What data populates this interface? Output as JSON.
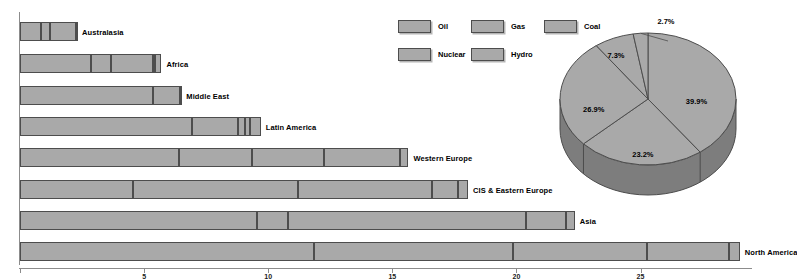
{
  "chart_data": [
    {
      "type": "bar",
      "orientation": "horizontal",
      "stacked": true,
      "title": "",
      "xlabel": "",
      "ylabel": "",
      "xlim": [
        0,
        29.5
      ],
      "grid": false,
      "axis_ticks": [
        {
          "value": 0,
          "label": ""
        },
        {
          "value": 5,
          "label": "5"
        },
        {
          "value": 10,
          "label": "10"
        },
        {
          "value": 15,
          "label": "15"
        },
        {
          "value": 20,
          "label": "20"
        },
        {
          "value": 25,
          "label": "25"
        }
      ],
      "legend": {
        "position": "top-center",
        "entries": [
          {
            "label": "Oil",
            "color": "#a9a9a9"
          },
          {
            "label": "Gas",
            "color": "#a9a9a9"
          },
          {
            "label": "Coal",
            "color": "#a9a9a9"
          },
          {
            "label": "Nuclear",
            "color": "#a9a9a9"
          },
          {
            "label": "Hydro",
            "color": "#a9a9a9"
          }
        ]
      },
      "categories": [
        "Australasia",
        "Africa",
        "Middle East",
        "Latin America",
        "Western Europe",
        "CIS & Eastern Europe",
        "Asia",
        "North America"
      ],
      "series": [
        {
          "name": "Oil",
          "values": [
            0.85,
            2.85,
            5.35,
            6.95,
            6.4,
            4.55,
            9.55,
            11.85
          ]
        },
        {
          "name": "Gas",
          "values": [
            0.35,
            0.8,
            1.1,
            1.85,
            2.95,
            6.65,
            1.25,
            8.0
          ]
        },
        {
          "name": "Coal",
          "values": [
            1.05,
            1.7,
            0.05,
            0.25,
            2.9,
            5.4,
            9.6,
            5.4
          ]
        },
        {
          "name": "Nuclear",
          "values": [
            0.0,
            0.1,
            0.0,
            0.2,
            3.05,
            1.05,
            1.6,
            3.3
          ]
        },
        {
          "name": "Hydro",
          "values": [
            0.05,
            0.25,
            0.0,
            0.45,
            0.35,
            0.4,
            0.35,
            0.45
          ]
        }
      ],
      "totals": [
        2.3,
        5.7,
        6.5,
        9.7,
        15.65,
        18.05,
        22.35,
        29.0
      ]
    },
    {
      "type": "pie",
      "title": "",
      "three_d": true,
      "labels": [
        "Oil",
        "Gas",
        "Coal",
        "Nuclear",
        "Hydro"
      ],
      "values": [
        39.9,
        23.2,
        26.9,
        7.3,
        2.7
      ],
      "value_labels": [
        "39.9%",
        "23.2%",
        "26.9%",
        "7.3%",
        "2.7%"
      ],
      "colors": [
        "#a9a9a9",
        "#a9a9a9",
        "#a9a9a9",
        "#a9a9a9",
        "#a9a9a9"
      ]
    }
  ],
  "bars": [
    {
      "label": "Australasia",
      "segments": [
        0.85,
        0.35,
        1.05,
        0.0,
        0.05
      ]
    },
    {
      "label": "Africa",
      "segments": [
        2.85,
        0.8,
        1.7,
        0.1,
        0.25
      ]
    },
    {
      "label": "Middle East",
      "segments": [
        5.35,
        1.1,
        0.05,
        0.0,
        0.0
      ]
    },
    {
      "label": "Latin America",
      "segments": [
        6.95,
        1.85,
        0.25,
        0.2,
        0.45
      ]
    },
    {
      "label": "Western Europe",
      "segments": [
        6.4,
        2.95,
        2.9,
        3.05,
        0.35
      ]
    },
    {
      "label": "CIS & Eastern Europe",
      "segments": [
        4.55,
        6.65,
        5.4,
        1.05,
        0.4
      ]
    },
    {
      "label": "Asia",
      "segments": [
        9.55,
        1.25,
        9.6,
        1.6,
        0.35
      ]
    },
    {
      "label": "North America",
      "segments": [
        11.85,
        8.0,
        5.4,
        3.3,
        0.45
      ]
    }
  ],
  "legend": {
    "entries": [
      {
        "label": "Oil"
      },
      {
        "label": "Gas"
      },
      {
        "label": "Coal"
      },
      {
        "label": "Nuclear"
      },
      {
        "label": "Hydro"
      }
    ]
  },
  "pie": {
    "slices": [
      {
        "label": "39.9%",
        "value": 39.9
      },
      {
        "label": "23.2%",
        "value": 23.2
      },
      {
        "label": "26.9%",
        "value": 26.9
      },
      {
        "label": "7.3%",
        "value": 7.3
      },
      {
        "label": "2.7%",
        "value": 2.7
      }
    ]
  },
  "axis": {
    "ticks": [
      {
        "value": 0,
        "label": ""
      },
      {
        "value": 5,
        "label": "5"
      },
      {
        "value": 10,
        "label": "10"
      },
      {
        "value": 15,
        "label": "15"
      },
      {
        "value": 20,
        "label": "20"
      },
      {
        "value": 25,
        "label": "25"
      }
    ]
  },
  "colors": {
    "fill": "#a9a9a9",
    "stroke": "#4d4d4d",
    "axis": "#8c8c8c",
    "text": "#000000",
    "pie_side": "#7d7d7d"
  }
}
